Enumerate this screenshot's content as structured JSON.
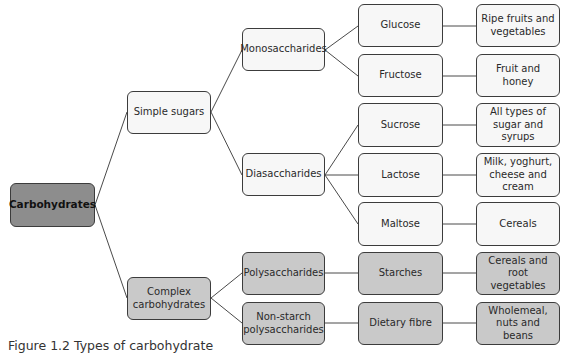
{
  "diagram": {
    "title": "Types of carbohydrate",
    "caption": "Figure 1.2 Types of carbohydrate",
    "colors": {
      "root_fill": "#8d8d8d",
      "simple_fill": "#f7f7f7",
      "complex_fill": "#c9c9c9",
      "border": "#3c3c3c",
      "line": "#4a4a4a"
    },
    "nodes": {
      "carbohydrates": "Carbohydrates",
      "simple_sugars": "Simple sugars",
      "complex_carbohydrates": "Complex carbohydrates",
      "monosaccharides": "Monosaccharides",
      "diasaccharides": "Diasaccharides",
      "polysaccharides": "Polysaccharides",
      "non_starch_polysaccharides": "Non-starch polysaccharides",
      "glucose": "Glucose",
      "fructose": "Fructose",
      "sucrose": "Sucrose",
      "lactose": "Lactose",
      "maltose": "Maltose",
      "starches": "Starches",
      "dietary_fibre": "Dietary fibre",
      "glucose_source": "Ripe fruits and vegetables",
      "fructose_source": "Fruit and honey",
      "sucrose_source": "All types of sugar and syrups",
      "lactose_source": "Milk, yoghurt, cheese and cream",
      "maltose_source": "Cereals",
      "starches_source": "Cereals and root vegetables",
      "dietary_fibre_source": "Wholemeal, nuts and beans"
    },
    "edges": [
      [
        "carbohydrates",
        "simple_sugars"
      ],
      [
        "carbohydrates",
        "complex_carbohydrates"
      ],
      [
        "simple_sugars",
        "monosaccharides"
      ],
      [
        "simple_sugars",
        "diasaccharides"
      ],
      [
        "monosaccharides",
        "glucose"
      ],
      [
        "monosaccharides",
        "fructose"
      ],
      [
        "diasaccharides",
        "sucrose"
      ],
      [
        "diasaccharides",
        "lactose"
      ],
      [
        "diasaccharides",
        "maltose"
      ],
      [
        "complex_carbohydrates",
        "polysaccharides"
      ],
      [
        "complex_carbohydrates",
        "non_starch_polysaccharides"
      ],
      [
        "polysaccharides",
        "starches"
      ],
      [
        "non_starch_polysaccharides",
        "dietary_fibre"
      ],
      [
        "glucose",
        "glucose_source"
      ],
      [
        "fructose",
        "fructose_source"
      ],
      [
        "sucrose",
        "sucrose_source"
      ],
      [
        "lactose",
        "lactose_source"
      ],
      [
        "maltose",
        "maltose_source"
      ],
      [
        "starches",
        "starches_source"
      ],
      [
        "dietary_fibre",
        "dietary_fibre_source"
      ]
    ]
  }
}
